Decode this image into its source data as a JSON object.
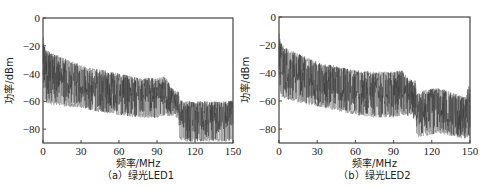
{
  "chart_data": [
    {
      "type": "line",
      "id": "a",
      "caption": "（a）绿光LED1",
      "xlabel": "频率/MHz",
      "ylabel": "功率/dBm",
      "xlim": [
        0,
        150
      ],
      "ylim": [
        -90,
        0
      ],
      "xticks": [
        0,
        30,
        60,
        90,
        120,
        150
      ],
      "yticks": [
        0,
        -20,
        -40,
        -60,
        -80
      ],
      "ytick_labels": [
        "0",
        "-20",
        "-40",
        "-60",
        "-80"
      ],
      "grid": false,
      "series_color": "#3a3a3a",
      "envelope": {
        "x": [
          0,
          1,
          3,
          10,
          20,
          30,
          45,
          60,
          75,
          90,
          97,
          100,
          104,
          106,
          107,
          108,
          115,
          125,
          135,
          145,
          150
        ],
        "upper": [
          -8,
          -20,
          -23,
          -26,
          -30,
          -34,
          -37,
          -40,
          -43,
          -43,
          -42,
          -48,
          -52,
          -53,
          -52,
          -59,
          -60,
          -60,
          -60,
          -60,
          -59
        ],
        "mean": [
          -20,
          -38,
          -40,
          -44,
          -47,
          -50,
          -53,
          -55,
          -56,
          -56,
          -56,
          -58,
          -60,
          -62,
          -60,
          -72,
          -73,
          -73,
          -73,
          -73,
          -73
        ],
        "lower": [
          -40,
          -60,
          -62,
          -63,
          -64,
          -65,
          -68,
          -70,
          -72,
          -72,
          -70,
          -71,
          -70,
          -73,
          -70,
          -88,
          -89,
          -89,
          -89,
          -89,
          -88
        ]
      }
    },
    {
      "type": "line",
      "id": "b",
      "caption": "（b）绿光LED2",
      "xlabel": "频率/MHz",
      "ylabel": "功率/dBm",
      "xlim": [
        0,
        150
      ],
      "ylim": [
        -90,
        0
      ],
      "xticks": [
        0,
        30,
        60,
        90,
        120,
        150
      ],
      "yticks": [
        0,
        -20,
        -40,
        -60,
        -80
      ],
      "ytick_labels": [
        "0",
        "-20",
        "-40",
        "-60",
        "-80"
      ],
      "grid": false,
      "series_color": "#3a3a3a",
      "envelope": {
        "x": [
          0,
          1,
          3,
          10,
          20,
          30,
          45,
          60,
          75,
          90,
          97,
          100,
          104,
          106,
          107,
          108,
          115,
          125,
          130,
          140,
          147,
          149,
          150
        ],
        "upper": [
          -8,
          -18,
          -20,
          -24,
          -28,
          -32,
          -35,
          -38,
          -39,
          -39,
          -38,
          -42,
          -45,
          -46,
          -45,
          -55,
          -52,
          -50,
          -52,
          -55,
          -57,
          -48,
          -50
        ],
        "mean": [
          -20,
          -35,
          -38,
          -42,
          -45,
          -48,
          -51,
          -54,
          -55,
          -55,
          -54,
          -56,
          -57,
          -60,
          -57,
          -70,
          -68,
          -66,
          -67,
          -69,
          -70,
          -68,
          -70
        ],
        "lower": [
          -38,
          -55,
          -58,
          -60,
          -62,
          -64,
          -67,
          -70,
          -72,
          -72,
          -70,
          -71,
          -70,
          -73,
          -70,
          -86,
          -85,
          -83,
          -84,
          -86,
          -87,
          -85,
          -86
        ]
      }
    }
  ]
}
